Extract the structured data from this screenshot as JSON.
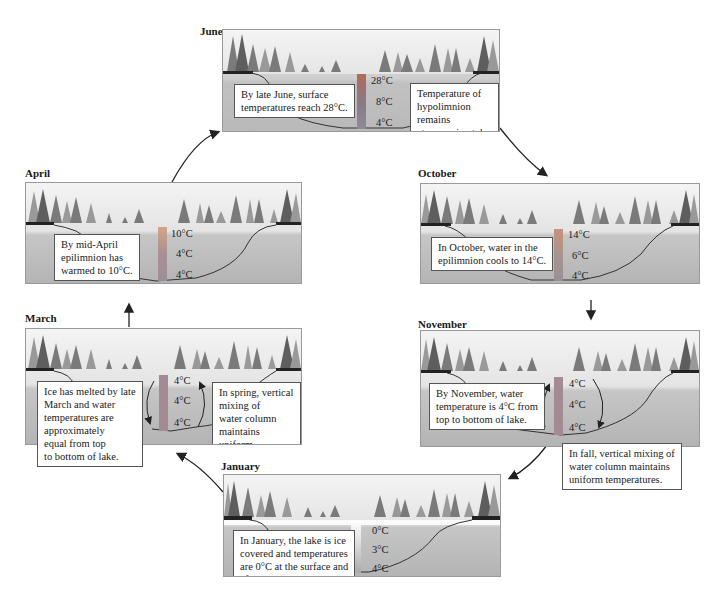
{
  "figure": {
    "panels": {
      "june": {
        "title": "June",
        "callouts": [
          "By late June, surface\ntemperatures reach 28°C.",
          "Temperature of\nhypolimnion remains\nat approximately 4°C."
        ],
        "temps": [
          "28°C",
          "8°C",
          "4°C"
        ],
        "bar_colors": [
          "#b06a5a",
          "#8a7a88",
          "#8d8b97"
        ]
      },
      "october": {
        "title": "October",
        "callouts": [
          "In October, water in the\nepilimnion cools to 14°C."
        ],
        "temps": [
          "14°C",
          "6°C",
          "4°C"
        ],
        "bar_colors": [
          "#c8927a",
          "#a9938f",
          "#9a8f96"
        ]
      },
      "november": {
        "title": "November",
        "callouts": [
          "By November, water\ntemperature is 4°C from\ntop to bottom of lake.",
          "In fall, vertical mixing of\nwater column maintains\nuniform temperatures."
        ],
        "temps": [
          "4°C",
          "4°C",
          "4°C"
        ],
        "bar_colors": [
          "#a48b93",
          "#a48b93",
          "#a48b93"
        ]
      },
      "january": {
        "title": "January",
        "callouts": [
          "In January, the lake is ice\ncovered and temperatures\nare 0°C at the surface and\n4°C at depth."
        ],
        "temps": [
          "0°C",
          "3°C",
          "4°C"
        ],
        "bar_colors": [
          "#ffffff",
          "#d8d8d8",
          "#a9a9a9"
        ]
      },
      "march": {
        "title": "March",
        "callouts": [
          "Ice has melted by late\nMarch and water\ntemperatures are\napproximately\nequal from top\nto bottom of lake.",
          "In spring, vertical mixing of\nwater column maintains\nuniform temperatures."
        ],
        "temps": [
          "4°C",
          "4°C",
          "4°C"
        ],
        "bar_colors": [
          "#a48b93",
          "#a48b93",
          "#a48b93"
        ]
      },
      "april": {
        "title": "April",
        "callouts": [
          "By mid-April\nepilimnion has\nwarmed to 10°C."
        ],
        "temps": [
          "10°C",
          "4°C",
          "4°C"
        ],
        "bar_colors": [
          "#d4a48a",
          "#a89094",
          "#9c8f98"
        ]
      }
    },
    "cycle_order": [
      "June",
      "October",
      "November",
      "January",
      "March",
      "April"
    ],
    "colors": {
      "sky": "#f2f2f2",
      "water": "#c4c4c4",
      "tree_dark": "#6e6e6e",
      "tree_light": "#9c9c9c",
      "outline": "#333333"
    }
  }
}
